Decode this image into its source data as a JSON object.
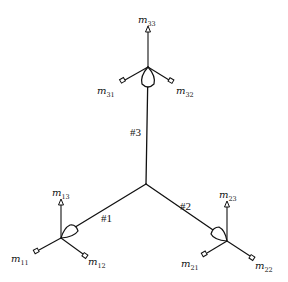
{
  "diagram": {
    "type": "three-arm branched structure with mirror/motor assemblies",
    "center": {
      "x": 146,
      "y": 184
    },
    "arms": [
      {
        "id": 1,
        "label": "#1",
        "joint": {
          "x": 61,
          "y": 238
        },
        "label_pos": {
          "x": 102,
          "y": 219
        }
      },
      {
        "id": 2,
        "label": "#2",
        "joint": {
          "x": 227,
          "y": 241
        },
        "label_pos": {
          "x": 180,
          "y": 207
        }
      },
      {
        "id": 3,
        "label": "#3",
        "joint": {
          "x": 148,
          "y": 67
        },
        "label_pos": {
          "x": 130,
          "y": 132
        }
      }
    ],
    "nodes": [
      {
        "name": "m11",
        "base": "m",
        "sub": "11",
        "arm": 1,
        "tip": {
          "x": 37,
          "y": 250
        },
        "label_pos": {
          "x": 12,
          "y": 262
        }
      },
      {
        "name": "m12",
        "base": "m",
        "sub": "12",
        "arm": 1,
        "tip": {
          "x": 84,
          "y": 256
        },
        "label_pos": {
          "x": 88,
          "y": 264
        }
      },
      {
        "name": "m13",
        "base": "m",
        "sub": "13",
        "arm": 1,
        "tip": {
          "x": 61,
          "y": 202
        },
        "label_pos": {
          "x": 52,
          "y": 194
        }
      },
      {
        "name": "m21",
        "base": "m",
        "sub": "21",
        "arm": 2,
        "tip": {
          "x": 205,
          "y": 254
        },
        "label_pos": {
          "x": 181,
          "y": 266
        }
      },
      {
        "name": "m22",
        "base": "m",
        "sub": "22",
        "arm": 2,
        "tip": {
          "x": 252,
          "y": 258
        },
        "label_pos": {
          "x": 255,
          "y": 268
        }
      },
      {
        "name": "m23",
        "base": "m",
        "sub": "23",
        "arm": 2,
        "tip": {
          "x": 227,
          "y": 203
        },
        "label_pos": {
          "x": 219,
          "y": 196
        }
      },
      {
        "name": "m31",
        "base": "m",
        "sub": "31",
        "arm": 3,
        "tip": {
          "x": 123,
          "y": 81
        },
        "label_pos": {
          "x": 98,
          "y": 92
        }
      },
      {
        "name": "m32",
        "base": "m",
        "sub": "32",
        "arm": 3,
        "tip": {
          "x": 171,
          "y": 81
        },
        "label_pos": {
          "x": 176,
          "y": 92
        }
      },
      {
        "name": "m33",
        "base": "m",
        "sub": "33",
        "arm": 3,
        "tip": {
          "x": 148,
          "y": 28
        },
        "label_pos": {
          "x": 138,
          "y": 20
        }
      }
    ]
  }
}
